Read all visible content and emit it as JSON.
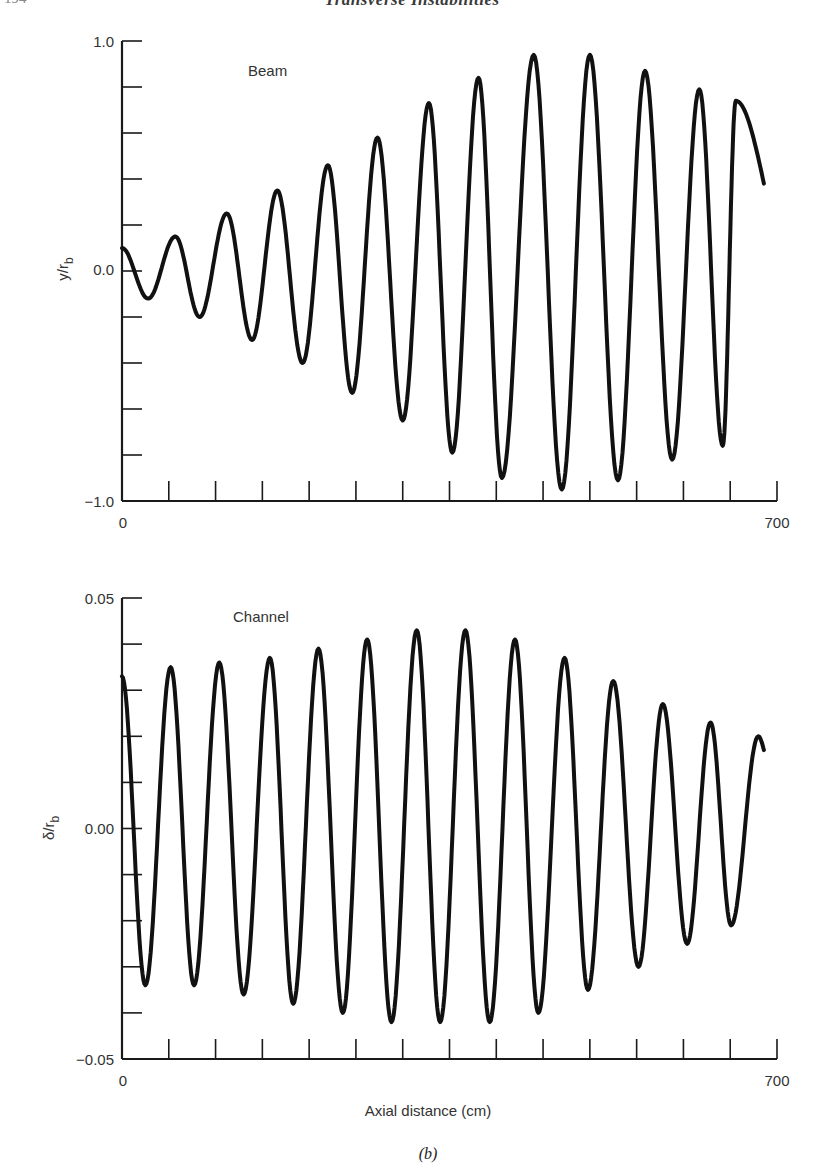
{
  "page": {
    "running_head": "Transverse Instabilities",
    "page_number": "194",
    "caption": "(b)"
  },
  "chart_data": [
    {
      "type": "line",
      "title": "",
      "series_label": "Beam",
      "xlabel": "",
      "ylabel": "y/r_b",
      "ylabel_main": "y/r",
      "ylabel_sub": "b",
      "xlim": [
        0,
        700
      ],
      "ylim": [
        -1.0,
        1.0
      ],
      "x_tick_labels": [
        "0",
        "700"
      ],
      "x_minor_ticks": [
        50,
        100,
        150,
        200,
        250,
        300,
        350,
        400,
        450,
        500,
        550,
        600,
        650,
        700
      ],
      "y_tick_labels": [
        "1.0",
        "0.0",
        "-1.0"
      ],
      "y_ticks": [
        1.0,
        0.8,
        0.6,
        0.4,
        0.2,
        0.0,
        -0.2,
        -0.4,
        -0.6,
        -0.8,
        -1.0
      ],
      "grid": false,
      "series": [
        {
          "name": "Beam",
          "x": [
            0,
            28,
            57,
            83,
            112,
            139,
            166,
            193,
            220,
            246,
            273,
            300,
            328,
            353,
            381,
            406,
            440,
            470,
            500,
            530,
            559,
            588,
            617,
            642,
            656
          ],
          "y": [
            0.1,
            -0.12,
            0.15,
            -0.2,
            0.25,
            -0.3,
            0.35,
            -0.4,
            0.46,
            -0.53,
            0.58,
            -0.65,
            0.73,
            -0.79,
            0.84,
            -0.9,
            0.94,
            -0.95,
            0.94,
            -0.91,
            0.87,
            -0.82,
            0.79,
            -0.76,
            0.74
          ]
        }
      ],
      "end_point": {
        "x": 686,
        "y": 0.38
      }
    },
    {
      "type": "line",
      "title": "",
      "series_label": "Channel",
      "xlabel": "Axial distance (cm)",
      "ylabel": "δ/r_b",
      "ylabel_main": "δ/r",
      "ylabel_sub": "b",
      "xlim": [
        0,
        700
      ],
      "ylim": [
        -0.05,
        0.05
      ],
      "x_tick_labels": [
        "0",
        "700"
      ],
      "x_minor_ticks": [
        50,
        100,
        150,
        200,
        250,
        300,
        350,
        400,
        450,
        500,
        550,
        600,
        650,
        700
      ],
      "y_tick_labels": [
        "0.05",
        "0.00",
        "-0.05"
      ],
      "y_ticks": [
        0.05,
        0.04,
        0.03,
        0.02,
        0.01,
        0.0,
        -0.01,
        -0.02,
        -0.03,
        -0.04,
        -0.05
      ],
      "grid": false,
      "series": [
        {
          "name": "Channel",
          "x": [
            0,
            25,
            52,
            77,
            104,
            130,
            158,
            183,
            210,
            236,
            262,
            288,
            315,
            340,
            367,
            393,
            420,
            445,
            473,
            498,
            525,
            552,
            578,
            604,
            629,
            651
          ],
          "y": [
            0.033,
            -0.034,
            0.035,
            -0.034,
            0.036,
            -0.036,
            0.037,
            -0.038,
            0.039,
            -0.04,
            0.041,
            -0.042,
            0.043,
            -0.042,
            0.043,
            -0.042,
            0.041,
            -0.04,
            0.037,
            -0.035,
            0.032,
            -0.03,
            0.027,
            -0.025,
            0.023,
            -0.021
          ]
        }
      ],
      "tail": {
        "x": [
          680,
          686
        ],
        "y": [
          0.02,
          0.017
        ]
      }
    }
  ]
}
